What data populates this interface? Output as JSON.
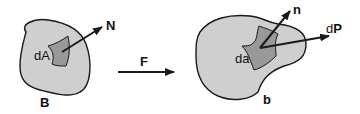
{
  "diagram": {
    "reference_body": {
      "label": "B",
      "area_label": "dA",
      "normal_label": "N"
    },
    "mapping": {
      "label": "F"
    },
    "current_body": {
      "label": "b",
      "area_label": "da",
      "normal_label": "n",
      "force_label_prefix": "d",
      "force_label_bold": "P"
    },
    "colors": {
      "body_fill": "#cfcfcf",
      "patch_fill": "#999999",
      "stroke": "#1a1a1a"
    }
  }
}
